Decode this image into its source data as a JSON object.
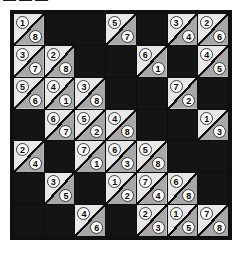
{
  "top_fragment": {
    "text": "▬▬▬"
  },
  "puzzle": {
    "type": "diagonal-split-number-grid",
    "rows": 7,
    "columns": 7,
    "colors": {
      "background": "#ffffff",
      "grid_border": "#111111",
      "blocked_cell": "#141414",
      "cell_upper": "#e8e8e8",
      "cell_lower": "#a8a8a8",
      "diagonal_line": "#0d0d0d",
      "number_circle": "#fdfdfd",
      "number_text": "#0a0a0a"
    },
    "cells": [
      [
        {
          "filled": true,
          "top": "1",
          "bottom": "8"
        },
        {
          "filled": false,
          "top": "",
          "bottom": ""
        },
        {
          "filled": false,
          "top": "",
          "bottom": ""
        },
        {
          "filled": true,
          "top": "5",
          "bottom": "7"
        },
        {
          "filled": false,
          "top": "",
          "bottom": ""
        },
        {
          "filled": true,
          "top": "3",
          "bottom": "4"
        },
        {
          "filled": true,
          "top": "2",
          "bottom": "6"
        }
      ],
      [
        {
          "filled": true,
          "top": "3",
          "bottom": "7"
        },
        {
          "filled": true,
          "top": "2",
          "bottom": "8"
        },
        {
          "filled": false,
          "top": "",
          "bottom": ""
        },
        {
          "filled": false,
          "top": "",
          "bottom": ""
        },
        {
          "filled": true,
          "top": "6",
          "bottom": "1"
        },
        {
          "filled": false,
          "top": "",
          "bottom": ""
        },
        {
          "filled": true,
          "top": "4",
          "bottom": "5"
        }
      ],
      [
        {
          "filled": true,
          "top": "5",
          "bottom": "6"
        },
        {
          "filled": true,
          "top": "4",
          "bottom": "1"
        },
        {
          "filled": true,
          "top": "3",
          "bottom": "8"
        },
        {
          "filled": false,
          "top": "",
          "bottom": ""
        },
        {
          "filled": false,
          "top": "",
          "bottom": ""
        },
        {
          "filled": true,
          "top": "7",
          "bottom": "2"
        },
        {
          "filled": false,
          "top": "",
          "bottom": ""
        }
      ],
      [
        {
          "filled": false,
          "top": "",
          "bottom": ""
        },
        {
          "filled": true,
          "top": "6",
          "bottom": "7"
        },
        {
          "filled": true,
          "top": "5",
          "bottom": "2"
        },
        {
          "filled": true,
          "top": "4",
          "bottom": "8"
        },
        {
          "filled": false,
          "top": "",
          "bottom": ""
        },
        {
          "filled": false,
          "top": "",
          "bottom": ""
        },
        {
          "filled": true,
          "top": "1",
          "bottom": "3"
        }
      ],
      [
        {
          "filled": true,
          "top": "2",
          "bottom": "4"
        },
        {
          "filled": false,
          "top": "",
          "bottom": ""
        },
        {
          "filled": true,
          "top": "7",
          "bottom": "1"
        },
        {
          "filled": true,
          "top": "6",
          "bottom": "3"
        },
        {
          "filled": true,
          "top": "5",
          "bottom": "8"
        },
        {
          "filled": false,
          "top": "",
          "bottom": ""
        },
        {
          "filled": false,
          "top": "",
          "bottom": ""
        }
      ],
      [
        {
          "filled": false,
          "top": "",
          "bottom": ""
        },
        {
          "filled": true,
          "top": "3",
          "bottom": "5"
        },
        {
          "filled": false,
          "top": "",
          "bottom": ""
        },
        {
          "filled": true,
          "top": "1",
          "bottom": "2"
        },
        {
          "filled": true,
          "top": "7",
          "bottom": "4"
        },
        {
          "filled": true,
          "top": "6",
          "bottom": "8"
        },
        {
          "filled": false,
          "top": "",
          "bottom": ""
        }
      ],
      [
        {
          "filled": false,
          "top": "",
          "bottom": ""
        },
        {
          "filled": false,
          "top": "",
          "bottom": ""
        },
        {
          "filled": true,
          "top": "4",
          "bottom": "6"
        },
        {
          "filled": false,
          "top": "",
          "bottom": ""
        },
        {
          "filled": true,
          "top": "2",
          "bottom": "3"
        },
        {
          "filled": true,
          "top": "1",
          "bottom": "5"
        },
        {
          "filled": true,
          "top": "7",
          "bottom": "8"
        }
      ]
    ]
  }
}
